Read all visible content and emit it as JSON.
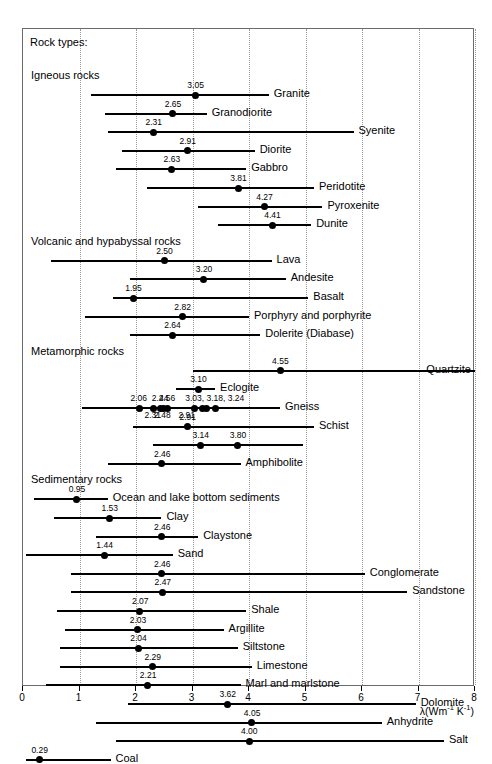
{
  "figure": {
    "legend_title": "Rock types:",
    "axis_title_lambda": "λ",
    "axis_title_units": "(Wm",
    "axis_title_sup1": "-1",
    "axis_title_mid": " K",
    "axis_title_sup2": "-1",
    "axis_title_end": ")"
  },
  "chart_data": {
    "type": "bar",
    "orientation": "horizontal",
    "title": "Rock types:",
    "xlabel": "λ (Wm-1 K-1)",
    "ylabel": "",
    "xlim": [
      0,
      8
    ],
    "xticks": [
      0,
      1,
      2,
      3,
      4,
      5,
      6,
      7,
      8
    ],
    "xticklabels": [
      "0",
      "1",
      "2",
      "3",
      "4",
      "5",
      "6",
      "7",
      "8"
    ],
    "grid": "vertical dotted gridlines at every integer tick",
    "legend": "none",
    "groups": [
      {
        "name": "Igneous rocks",
        "items": [
          {
            "label": "Granite",
            "range": [
              1.2,
              4.35
            ],
            "points": [
              3.05
            ],
            "point_labels": [
              "3.05"
            ],
            "label_side": "right"
          },
          {
            "label": "Granodiorite",
            "range": [
              1.45,
              3.25
            ],
            "points": [
              2.65
            ],
            "point_labels": [
              "2.65"
            ],
            "label_side": "right"
          },
          {
            "label": "Syenite",
            "range": [
              1.5,
              5.85
            ],
            "points": [
              2.31
            ],
            "point_labels": [
              "2.31"
            ],
            "label_side": "right"
          },
          {
            "label": "Diorite",
            "range": [
              1.75,
              4.1
            ],
            "points": [
              2.91
            ],
            "point_labels": [
              "2.91"
            ],
            "label_side": "right"
          },
          {
            "label": "Gabbro",
            "range": [
              1.65,
              3.95
            ],
            "points": [
              2.63
            ],
            "point_labels": [
              "2.63"
            ],
            "label_side": "right"
          },
          {
            "label": "Peridotite",
            "range": [
              2.2,
              5.15
            ],
            "points": [
              3.81
            ],
            "point_labels": [
              "3.81"
            ],
            "label_side": "right"
          },
          {
            "label": "Pyroxenite",
            "range": [
              3.1,
              5.3
            ],
            "points": [
              4.27
            ],
            "point_labels": [
              "4.27"
            ],
            "label_side": "right"
          },
          {
            "label": "Dunite",
            "range": [
              3.45,
              5.1
            ],
            "points": [
              4.41
            ],
            "point_labels": [
              "4.41"
            ],
            "label_side": "right"
          }
        ]
      },
      {
        "name": "Volcanic and hypabyssal rocks",
        "items": [
          {
            "label": "Lava",
            "range": [
              0.5,
              4.4
            ],
            "points": [
              2.5
            ],
            "point_labels": [
              "2.50"
            ],
            "label_side": "right"
          },
          {
            "label": "Andesite",
            "range": [
              1.9,
              4.65
            ],
            "points": [
              3.2
            ],
            "point_labels": [
              "3.20"
            ],
            "label_side": "right"
          },
          {
            "label": "Basalt",
            "range": [
              1.6,
              5.05
            ],
            "points": [
              1.95
            ],
            "point_labels": [
              "1.95"
            ],
            "label_side": "right"
          },
          {
            "label": "Porphyry and porphyrite",
            "range": [
              1.1,
              4.0
            ],
            "points": [
              2.82
            ],
            "point_labels": [
              "2.82"
            ],
            "label_side": "right"
          },
          {
            "label": "Dolerite (Diabase)",
            "range": [
              1.9,
              4.2
            ],
            "points": [
              2.64
            ],
            "point_labels": [
              "2.64"
            ],
            "label_side": "right"
          }
        ]
      },
      {
        "name": "Metamorphic rocks",
        "items": [
          {
            "label": "Quartzite",
            "range": [
              3.0,
              8.0
            ],
            "points": [
              4.55
            ],
            "point_labels": [
              "4.55"
            ],
            "label_side": "right-edge"
          },
          {
            "label": "Eclogite",
            "range": [
              2.7,
              3.4
            ],
            "points": [
              3.1
            ],
            "point_labels": [
              "3.10"
            ],
            "label_side": "right"
          },
          {
            "label": "Gneiss",
            "range": [
              1.05,
              4.55
            ],
            "points": [
              2.06,
              2.31,
              2.44,
              2.48,
              2.56,
              3.03,
              3.18,
              3.24,
              3.4
            ],
            "point_labels_above": [
              "2.06",
              "2.44",
              "2.56",
              "3.03, 3.18, 3.24"
            ],
            "point_labels_below": [
              "2.31",
              "2.48",
              "2.91"
            ],
            "label_side": "right"
          },
          {
            "label": "Schist",
            "range": [
              1.95,
              5.15
            ],
            "points": [
              2.91
            ],
            "point_labels": [
              "2.91"
            ],
            "label_side": "right"
          },
          {
            "label": "Schist2",
            "range": [
              2.3,
              4.95
            ],
            "points": [
              3.14,
              3.8
            ],
            "point_labels": [
              "3.14",
              "3.80"
            ],
            "label_side": "none"
          },
          {
            "label": "Amphibolite",
            "range": [
              1.5,
              3.85
            ],
            "points": [
              2.46
            ],
            "point_labels": [
              "2.46"
            ],
            "label_side": "right"
          }
        ]
      },
      {
        "name": "Sedimentary rocks",
        "items": [
          {
            "label": "Ocean and lake bottom sediments",
            "range": [
              0.2,
              1.5
            ],
            "points": [
              0.95
            ],
            "point_labels": [
              "0.95"
            ],
            "label_side": "right"
          },
          {
            "label": "Clay",
            "range": [
              0.55,
              2.45
            ],
            "points": [
              1.53
            ],
            "point_labels": [
              "1.53"
            ],
            "label_side": "right"
          },
          {
            "label": "Claystone",
            "range": [
              1.3,
              3.1
            ],
            "points": [
              2.46
            ],
            "point_labels": [
              "2.46"
            ],
            "label_side": "right"
          },
          {
            "label": "Sand",
            "range": [
              0.05,
              2.65
            ],
            "points": [
              1.44
            ],
            "point_labels": [
              "1.44"
            ],
            "label_side": "right"
          },
          {
            "label": "Conglomerate",
            "range": [
              0.85,
              6.05
            ],
            "points": [
              2.46
            ],
            "point_labels": [
              "2.46"
            ],
            "label_side": "right"
          },
          {
            "label": "Sandstone",
            "range": [
              0.85,
              6.8
            ],
            "points": [
              2.47
            ],
            "point_labels": [
              "2.47"
            ],
            "label_side": "right"
          },
          {
            "label": "Shale",
            "range": [
              0.6,
              3.95
            ],
            "points": [
              2.07
            ],
            "point_labels": [
              "2.07"
            ],
            "label_side": "right"
          },
          {
            "label": "Argillite",
            "range": [
              0.75,
              3.55
            ],
            "points": [
              2.03
            ],
            "point_labels": [
              "2.03"
            ],
            "label_side": "right"
          },
          {
            "label": "Siltstone",
            "range": [
              0.65,
              3.8
            ],
            "points": [
              2.04
            ],
            "point_labels": [
              "2.04"
            ],
            "label_side": "right"
          },
          {
            "label": "Limestone",
            "range": [
              0.65,
              4.05
            ],
            "points": [
              2.29
            ],
            "point_labels": [
              "2.29"
            ],
            "label_side": "right"
          },
          {
            "label": "Marl and marlstone",
            "range": [
              0.4,
              3.85
            ],
            "points": [
              2.21
            ],
            "point_labels": [
              "2.21"
            ],
            "label_side": "right"
          },
          {
            "label": "Dolomite",
            "range": [
              1.85,
              6.95
            ],
            "points": [
              3.62
            ],
            "point_labels": [
              "3.62"
            ],
            "label_side": "right"
          },
          {
            "label": "Anhydrite",
            "range": [
              1.3,
              6.35
            ],
            "points": [
              4.05
            ],
            "point_labels": [
              "4.05"
            ],
            "label_side": "right"
          },
          {
            "label": "Salt",
            "range": [
              1.65,
              7.45
            ],
            "points": [
              4.0
            ],
            "point_labels": [
              "4.00"
            ],
            "label_side": "right"
          },
          {
            "label": "Coal",
            "range": [
              0.05,
              1.55
            ],
            "points": [
              0.29
            ],
            "point_labels": [
              "0.29"
            ],
            "label_side": "right"
          }
        ]
      }
    ]
  }
}
